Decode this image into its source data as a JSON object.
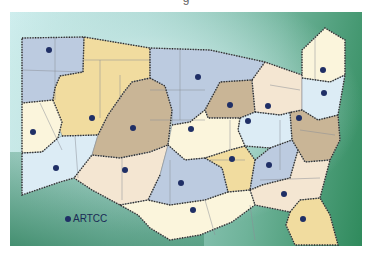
{
  "map": {
    "title_fragment": "g",
    "legend": {
      "label": "ARTCC",
      "marker_color": "#1f2f66"
    },
    "colors": {
      "blue": "#bccbe0",
      "tan": "#c9b596",
      "yellow": "#f1dc9f",
      "cream": "#fbf5dc",
      "peach": "#f4e6d2",
      "lightblue": "#dcecf5",
      "border": "#2a2a2a",
      "state_line": "#8a8f96"
    },
    "artcc_centers": [
      {
        "x": 49,
        "y": 50
      },
      {
        "x": 198,
        "y": 77
      },
      {
        "x": 323,
        "y": 70
      },
      {
        "x": 324,
        "y": 93
      },
      {
        "x": 230,
        "y": 105
      },
      {
        "x": 268,
        "y": 106
      },
      {
        "x": 248,
        "y": 121
      },
      {
        "x": 299,
        "y": 118
      },
      {
        "x": 33,
        "y": 132
      },
      {
        "x": 92,
        "y": 118
      },
      {
        "x": 133,
        "y": 128
      },
      {
        "x": 191,
        "y": 129
      },
      {
        "x": 232,
        "y": 159
      },
      {
        "x": 269,
        "y": 165
      },
      {
        "x": 56,
        "y": 168
      },
      {
        "x": 125,
        "y": 170
      },
      {
        "x": 181,
        "y": 183
      },
      {
        "x": 284,
        "y": 194
      },
      {
        "x": 193,
        "y": 210
      },
      {
        "x": 303,
        "y": 219
      }
    ]
  }
}
